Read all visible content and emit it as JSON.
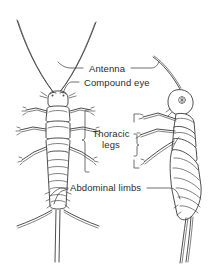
{
  "figure": {
    "background_color": "#ffffff",
    "ink_color": "#3a3a3a",
    "text_color": "#2b2b2b",
    "width": 220,
    "height": 270
  },
  "labels": {
    "antenna": "Antenna",
    "compound_eye": "Compound eye",
    "thoracic_legs_line1": "Thoracic",
    "thoracic_legs_line2": "legs",
    "abdominal_limbs": "Abdominal limbs"
  },
  "views": {
    "dorsal": {
      "name": "dorsal view",
      "antennae_count": 2,
      "leg_pairs": 3,
      "caudal_filaments": 3
    },
    "lateral": {
      "name": "lateral view",
      "antennae_count": 1,
      "leg_pairs": 3,
      "caudal_filaments": 2
    }
  }
}
